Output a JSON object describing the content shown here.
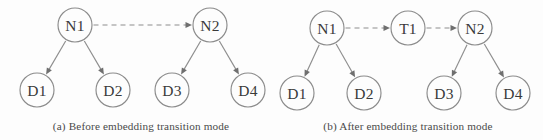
{
  "figure": {
    "background_color": "#fdfdfd",
    "stroke_color": "#8b8b8b",
    "text_color": "#3a3a3a",
    "panels": [
      {
        "id": "panel-a",
        "caption": "(a) Before embedding transition mode",
        "caption_x": 141,
        "caption_y": 130,
        "nodes": [
          {
            "id": "a-n1",
            "label": "N1",
            "cx": 75,
            "cy": 25,
            "r": 17
          },
          {
            "id": "a-n2",
            "label": "N2",
            "cx": 210,
            "cy": 25,
            "r": 17
          },
          {
            "id": "a-d1",
            "label": "D1",
            "cx": 37,
            "cy": 90,
            "r": 17
          },
          {
            "id": "a-d2",
            "label": "D2",
            "cx": 113,
            "cy": 90,
            "r": 17
          },
          {
            "id": "a-d3",
            "label": "D3",
            "cx": 172,
            "cy": 90,
            "r": 17
          },
          {
            "id": "a-d4",
            "label": "D4",
            "cx": 248,
            "cy": 90,
            "r": 17
          }
        ],
        "edges": [
          {
            "id": "a-edge-n1-n2",
            "from": "a-n1",
            "to": "a-n2",
            "style": "dashed"
          },
          {
            "id": "a-edge-n1-d1",
            "from": "a-n1",
            "to": "a-d1",
            "style": "solid"
          },
          {
            "id": "a-edge-n1-d2",
            "from": "a-n1",
            "to": "a-d2",
            "style": "solid"
          },
          {
            "id": "a-edge-n2-d3",
            "from": "a-n2",
            "to": "a-d3",
            "style": "solid"
          },
          {
            "id": "a-edge-n2-d4",
            "from": "a-n2",
            "to": "a-d4",
            "style": "solid"
          }
        ]
      },
      {
        "id": "panel-b",
        "caption": "(b) After embedding transition mode",
        "caption_x": 408,
        "caption_y": 130,
        "nodes": [
          {
            "id": "b-n1",
            "label": "N1",
            "cx": 327,
            "cy": 28,
            "r": 17
          },
          {
            "id": "b-t1",
            "label": "T1",
            "cx": 408,
            "cy": 28,
            "r": 17
          },
          {
            "id": "b-n2",
            "label": "N2",
            "cx": 475,
            "cy": 28,
            "r": 17
          },
          {
            "id": "b-d1",
            "label": "D1",
            "cx": 297,
            "cy": 93,
            "r": 17
          },
          {
            "id": "b-d2",
            "label": "D2",
            "cx": 364,
            "cy": 93,
            "r": 17
          },
          {
            "id": "b-d3",
            "label": "D3",
            "cx": 444,
            "cy": 93,
            "r": 17
          },
          {
            "id": "b-d4",
            "label": "D4",
            "cx": 513,
            "cy": 93,
            "r": 17
          }
        ],
        "edges": [
          {
            "id": "b-edge-n1-t1",
            "from": "b-n1",
            "to": "b-t1",
            "style": "dashed"
          },
          {
            "id": "b-edge-t1-n2",
            "from": "b-t1",
            "to": "b-n2",
            "style": "dashed"
          },
          {
            "id": "b-edge-n1-d1",
            "from": "b-n1",
            "to": "b-d1",
            "style": "solid"
          },
          {
            "id": "b-edge-n1-d2",
            "from": "b-n1",
            "to": "b-d2",
            "style": "solid"
          },
          {
            "id": "b-edge-n2-d3",
            "from": "b-n2",
            "to": "b-d3",
            "style": "solid"
          },
          {
            "id": "b-edge-n2-d4",
            "from": "b-n2",
            "to": "b-d4",
            "style": "solid"
          }
        ]
      }
    ]
  }
}
